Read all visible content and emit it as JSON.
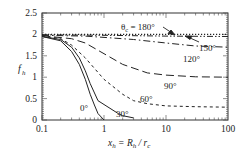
{
  "chart_data": {
    "type": "line",
    "title": "",
    "xlabel": "x_h = R_h / r_c",
    "ylabel": "f_h",
    "xscale": "log",
    "xlim": [
      0.1,
      100
    ],
    "ylim": [
      0,
      2.5
    ],
    "xticks": [
      "0.1",
      "1",
      "10",
      "100"
    ],
    "yticks": [
      "0",
      "0.5",
      "1",
      "1.5",
      "2",
      "2.5"
    ],
    "grid": false,
    "legend": "inline labels",
    "series": [
      {
        "name": "0°",
        "style": "solid",
        "x": [
          0.1,
          0.2,
          0.3,
          0.4,
          0.5,
          0.6,
          0.7,
          0.8,
          1.0
        ],
        "y": [
          1.95,
          1.85,
          1.6,
          1.3,
          0.95,
          0.6,
          0.35,
          0.15,
          0.0
        ]
      },
      {
        "name": "30°",
        "style": "solid",
        "x": [
          0.1,
          0.2,
          0.3,
          0.4,
          0.5,
          0.6,
          0.8,
          1.7,
          2,
          3
        ],
        "y": [
          1.95,
          1.88,
          1.7,
          1.45,
          1.15,
          0.85,
          0.45,
          0.15,
          0.1,
          0.05
        ]
      },
      {
        "name": "60°",
        "style": "dashed",
        "x": [
          0.1,
          0.2,
          0.3,
          0.5,
          1,
          2,
          3,
          5,
          10,
          30,
          100
        ],
        "y": [
          1.97,
          1.9,
          1.75,
          1.45,
          0.95,
          0.6,
          0.45,
          0.38,
          0.33,
          0.31,
          0.3
        ]
      },
      {
        "name": "90°",
        "style": "long-dash",
        "x": [
          0.1,
          0.3,
          0.5,
          1,
          2,
          5,
          10,
          30,
          100
        ],
        "y": [
          1.97,
          1.9,
          1.8,
          1.55,
          1.3,
          1.1,
          1.05,
          1.01,
          1.0
        ]
      },
      {
        "name": "120°",
        "style": "dash-dot",
        "x": [
          0.1,
          0.5,
          1,
          3,
          10,
          30,
          100
        ],
        "y": [
          1.98,
          1.96,
          1.93,
          1.88,
          1.8,
          1.73,
          1.7
        ]
      },
      {
        "name": "150°",
        "style": "dash-dot-dot",
        "x": [
          0.1,
          1,
          10,
          100
        ],
        "y": [
          1.99,
          1.98,
          1.96,
          1.95
        ]
      },
      {
        "name": "θc = 180°",
        "style": "dotted",
        "x": [
          0.1,
          1,
          10,
          100
        ],
        "y": [
          2.0,
          2.0,
          2.0,
          2.0
        ]
      }
    ],
    "annotations": [
      "θc = 180°",
      "150°",
      "120°",
      "90°",
      "60°",
      "30°",
      "0°"
    ]
  },
  "labels": {
    "y_axis": "f",
    "y_axis_sub": "h",
    "x_axis_main": "x",
    "x_axis_sub": "h",
    "x_axis_eq": " = R",
    "x_axis_sub2": "h",
    "x_axis_div": " / r",
    "x_axis_sub3": "c",
    "theta": "θ",
    "theta_sub": "c",
    "theta_val": " = 180°",
    "l150": "150°",
    "l120": "120°",
    "l90": "90°",
    "l60": "60°",
    "l30": "30°",
    "l0": "0°",
    "yt0": "0",
    "yt1": "0.5",
    "yt2": "1",
    "yt3": "1.5",
    "yt4": "2",
    "yt5": "2.5",
    "xt0": "0.1",
    "xt1": "1",
    "xt2": "10",
    "xt3": "100"
  }
}
